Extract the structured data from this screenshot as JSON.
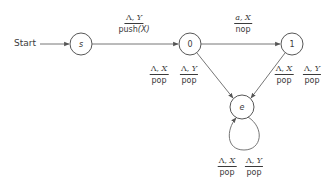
{
  "diagram": {
    "type": "pushdown-automaton",
    "start_label": "Start",
    "states": [
      {
        "id": "s",
        "label": "s",
        "italic": true
      },
      {
        "id": "0",
        "label": "0",
        "italic": false
      },
      {
        "id": "1",
        "label": "1",
        "italic": false
      },
      {
        "id": "e",
        "label": "e",
        "italic": true
      }
    ],
    "transitions": [
      {
        "from": "s",
        "to": "0",
        "input": "Λ",
        "stack": "Y",
        "action": "push(X)"
      },
      {
        "from": "0",
        "to": "1",
        "input": "a",
        "stack": "X",
        "action": "nop"
      },
      {
        "from": "0",
        "to": "e",
        "labels": [
          {
            "input": "Λ",
            "stack": "X",
            "action": "pop"
          },
          {
            "input": "Λ",
            "stack": "Y",
            "action": "pop"
          }
        ]
      },
      {
        "from": "1",
        "to": "e",
        "labels": [
          {
            "input": "Λ",
            "stack": "X",
            "action": "pop"
          },
          {
            "input": "Λ",
            "stack": "Y",
            "action": "pop"
          }
        ]
      },
      {
        "from": "e",
        "to": "e",
        "labels": [
          {
            "input": "Λ",
            "stack": "X",
            "action": "pop"
          },
          {
            "input": "Λ",
            "stack": "Y",
            "action": "pop"
          }
        ]
      }
    ]
  },
  "labels": {
    "start": "Start",
    "s": "s",
    "q0": "0",
    "q1": "1",
    "e": "e",
    "s_to_0": {
      "num_a": "Λ, ",
      "num_b": "Y",
      "den_a": "push",
      "den_b": "(X)"
    },
    "q0_to_1": {
      "num_a": "a",
      "num_b": ", X",
      "den": "nop"
    },
    "q0_to_e_x": {
      "num_a": "Λ, ",
      "num_b": "X",
      "den": "pop"
    },
    "q0_to_e_y": {
      "num_a": "Λ, ",
      "num_b": "Y",
      "den": "pop"
    },
    "q1_to_e_x": {
      "num_a": "Λ, ",
      "num_b": "X",
      "den": "pop"
    },
    "q1_to_e_y": {
      "num_a": "Λ, ",
      "num_b": "Y",
      "den": "pop"
    },
    "e_loop_x": {
      "num_a": "Λ, ",
      "num_b": "X",
      "den": "pop"
    },
    "e_loop_y": {
      "num_a": "Λ, ",
      "num_b": "Y",
      "den": "pop"
    }
  },
  "colors": {
    "stroke": "#4a4a4a",
    "text": "#3a3a3a",
    "background": "#ffffff"
  }
}
